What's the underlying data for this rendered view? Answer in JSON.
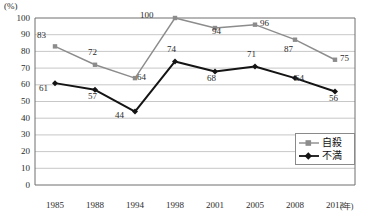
{
  "chart_data": {
    "type": "line",
    "title": "",
    "xlabel": "年",
    "ylabel": "(%)",
    "unit_label": "(%)",
    "x_unit_suffix": "(年)",
    "categories": [
      "1985",
      "1988",
      "1994",
      "1998",
      "2001",
      "2005",
      "2008",
      "2013"
    ],
    "ylim": [
      0,
      100
    ],
    "ytick_step": 10,
    "yticks": [
      "100",
      "90",
      "80",
      "70",
      "60",
      "50",
      "40",
      "30",
      "20",
      "10",
      "0"
    ],
    "grid": true,
    "legend_position": "bottom-right",
    "series": [
      {
        "name": "自殺",
        "color": "#8c8c8c",
        "marker": "square",
        "values": [
          83,
          72,
          64,
          100,
          94,
          96,
          87,
          75
        ],
        "labels": [
          "83",
          "72",
          "64",
          "100",
          "94",
          "96",
          "87",
          "75"
        ]
      },
      {
        "name": "不満",
        "color": "#141414",
        "marker": "diamond",
        "values": [
          61,
          57,
          44,
          74,
          68,
          71,
          64,
          56
        ],
        "labels": [
          "61",
          "57",
          "44",
          "74",
          "68",
          "71",
          "64",
          "56"
        ]
      }
    ]
  },
  "legend": {
    "items": [
      {
        "label": "自殺",
        "color": "#8c8c8c"
      },
      {
        "label": "不満",
        "color": "#141414"
      }
    ]
  }
}
